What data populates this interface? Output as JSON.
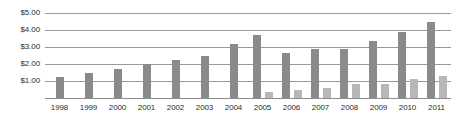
{
  "chart_data": {
    "type": "bar",
    "title": "",
    "subtitle": "",
    "xlabel": "",
    "ylabel": "",
    "ylim": [
      0,
      5
    ],
    "ytick_labels": [
      "$1.00",
      "$2.00",
      "$3.00",
      "$4.00",
      "$5.00"
    ],
    "ytick_values": [
      1,
      2,
      3,
      4,
      5
    ],
    "grid": true,
    "legend": "none",
    "orientation": "vertical",
    "categories": [
      "1998",
      "1999",
      "2000",
      "2001",
      "2002",
      "2003",
      "2004",
      "2005",
      "2006",
      "2007",
      "2008",
      "2009",
      "2010",
      "2011"
    ],
    "series": [
      {
        "name": "series-1",
        "color": "#8a8a8a",
        "values": [
          1.25,
          1.45,
          1.7,
          2.0,
          2.25,
          2.45,
          3.2,
          3.7,
          2.65,
          2.9,
          2.9,
          3.35,
          3.9,
          4.45
        ]
      },
      {
        "name": "series-2",
        "color": "#b7b7b7",
        "values": [
          null,
          null,
          null,
          null,
          null,
          null,
          null,
          0.35,
          0.45,
          0.6,
          0.8,
          0.8,
          1.1,
          1.3
        ]
      }
    ],
    "colors": {
      "series_1": "#8a8a8a",
      "series_2": "#b7b7b7",
      "gridline": "#9a9a9a",
      "text": "#2b2b2b",
      "background": "#ffffff"
    }
  }
}
